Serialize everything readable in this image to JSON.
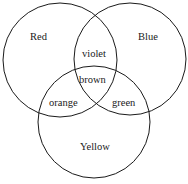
{
  "diagram": {
    "type": "venn",
    "sets": [
      {
        "name": "Red",
        "cx": 60,
        "cy": 60,
        "r": 57
      },
      {
        "name": "Blue",
        "cx": 130,
        "cy": 59,
        "r": 56
      },
      {
        "name": "Yellow",
        "cx": 94,
        "cy": 122,
        "r": 56
      }
    ],
    "labels": {
      "red": "Red",
      "blue": "Blue",
      "yellow": "Yellow",
      "red_blue": "violet",
      "red_yellow": "orange",
      "blue_yellow": "green",
      "all": "brown"
    },
    "stroke_color": "#1a1a1a"
  }
}
